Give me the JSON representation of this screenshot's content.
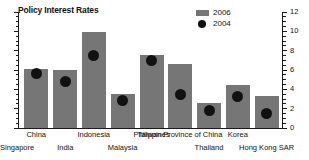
{
  "chart_data": {
    "type": "bar",
    "title": "Policy Interest Rates",
    "xlabel": "",
    "ylabel": "",
    "ylim": [
      0,
      12
    ],
    "yticks": [
      0,
      2,
      4,
      6,
      8,
      10,
      12
    ],
    "ytick_labels": [
      "0",
      "2",
      "4",
      "6",
      "8",
      "10",
      "12"
    ],
    "grid": false,
    "axis_position": "right",
    "legend_position": "top-right",
    "categories": [
      "China",
      "India",
      "Indonesia",
      "Malaysia",
      "Philippines",
      "Thailand",
      "Hong Kong SAR",
      "Korea",
      "Singapore"
    ],
    "category_label_rows": [
      {
        "row": "top",
        "labels": [
          "China",
          "Indonesia",
          "Philippines",
          "Taiwan Province of China",
          "Korea"
        ]
      },
      {
        "row": "bottom",
        "labels": [
          "India",
          "Malaysia",
          "Thailand",
          "Hong Kong SAR",
          "Singapore"
        ]
      }
    ],
    "series": [
      {
        "name": "2006",
        "mark": "bar",
        "color": "#767676",
        "values": [
          6.1,
          6.0,
          9.9,
          3.5,
          7.6,
          6.6,
          2.6,
          4.5,
          3.3
        ]
      },
      {
        "name": "2004",
        "mark": "dot",
        "color": "#111111",
        "values": [
          5.6,
          4.8,
          7.5,
          2.8,
          7.0,
          3.5,
          1.8,
          3.3,
          1.5
        ]
      }
    ]
  },
  "legend": {
    "entries": [
      {
        "label": "2006",
        "marker": "bar-swatch"
      },
      {
        "label": "2004",
        "marker": "dot-swatch"
      }
    ]
  },
  "colors": {
    "bar": "#767676",
    "dot": "#111111",
    "axis": "#1a1a1a",
    "text": "#111111",
    "background": "#ffffff"
  }
}
